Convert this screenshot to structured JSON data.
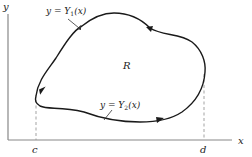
{
  "diagram": {
    "type": "region-between-curves",
    "axes": {
      "x_label": "x",
      "y_label": "y"
    },
    "bounds": {
      "left_label": "c",
      "right_label": "d"
    },
    "region_label": "R",
    "curves": {
      "upper": {
        "label_lhs": "y = Y",
        "label_sub": "1",
        "label_rhs": "(x)"
      },
      "lower": {
        "label_lhs": "y = Y",
        "label_sub": "2",
        "label_rhs": "(x)"
      }
    },
    "orientation": "counterclockwise",
    "colors": {
      "curve": "#1a1a1a",
      "axes": "#888888",
      "dashed": "#999999",
      "text": "#222222"
    }
  }
}
